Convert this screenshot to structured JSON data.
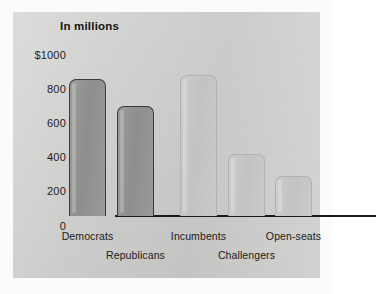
{
  "chart_data": {
    "type": "bar",
    "title": "In millions",
    "xlabel": "",
    "ylabel": "",
    "ylim": [
      0,
      1000
    ],
    "grid": false,
    "legend": null,
    "ytick_labels": [
      "$1000",
      "800",
      "600",
      "400",
      "200",
      "0"
    ],
    "ytick_values": [
      1000,
      800,
      600,
      400,
      200,
      0
    ],
    "categories": [
      "Democrats",
      "Republicans",
      "Incumbents",
      "Challengers",
      "Open-seats"
    ],
    "values": [
      800,
      640,
      820,
      360,
      235
    ],
    "bar_shades": [
      "dark",
      "dark",
      "light",
      "light",
      "light"
    ],
    "colors": {
      "panel_background": "#d3d3d1",
      "bar_dark": "#939391",
      "bar_dark_outline": "#3b3b3b",
      "bar_light": "#c6c6c4",
      "bar_light_outline": "#b2b2b0",
      "axis": "#1a1a1a",
      "text": "#1b1b1b",
      "page_background": "#ffffff"
    }
  },
  "chart": {
    "title": "In millions",
    "y_axis": {
      "ticks": [
        {
          "label": "$1000",
          "value": 1000
        },
        {
          "label": "800",
          "value": 800
        },
        {
          "label": "600",
          "value": 600
        },
        {
          "label": "400",
          "value": 400
        },
        {
          "label": "200",
          "value": 200
        },
        {
          "label": "0",
          "value": 0
        }
      ]
    },
    "bars": [
      {
        "label": "Democrats",
        "value": 800,
        "shade": "dark",
        "row": 1
      },
      {
        "label": "Republicans",
        "value": 640,
        "shade": "dark",
        "row": 2
      },
      {
        "label": "Incumbents",
        "value": 820,
        "shade": "light",
        "row": 1
      },
      {
        "label": "Challengers",
        "value": 360,
        "shade": "light",
        "row": 2
      },
      {
        "label": "Open-seats",
        "value": 235,
        "shade": "light",
        "row": 1
      }
    ]
  }
}
